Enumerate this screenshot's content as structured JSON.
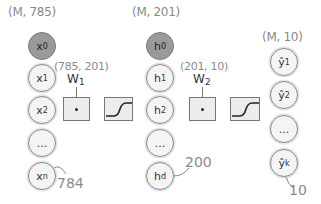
{
  "input_layer": {
    "shape": "(M, 785)",
    "nodes": [
      {
        "symbol": "x",
        "sub": "0",
        "bias": true
      },
      {
        "symbol": "x",
        "sub": "1",
        "bias": false
      },
      {
        "symbol": "x",
        "sub": "2",
        "bias": false
      },
      {
        "symbol": "...",
        "sub": "",
        "bias": false
      },
      {
        "symbol": "x",
        "sub": "n",
        "bias": false
      }
    ],
    "count_annotation": "784"
  },
  "weights_1": {
    "label": "W",
    "sub": "1",
    "shape": "(785, 201)",
    "operation": "dot-product"
  },
  "activation_1": {
    "type": "sigmoid"
  },
  "hidden_layer": {
    "shape": "(M, 201)",
    "nodes": [
      {
        "symbol": "h",
        "sub": "0",
        "bias": true
      },
      {
        "symbol": "h",
        "sub": "1",
        "bias": false
      },
      {
        "symbol": "h",
        "sub": "2",
        "bias": false
      },
      {
        "symbol": "...",
        "sub": "",
        "bias": false
      },
      {
        "symbol": "h",
        "sub": "d",
        "bias": false
      }
    ],
    "count_annotation": "200"
  },
  "weights_2": {
    "label": "W",
    "sub": "2",
    "shape": "(201, 10)",
    "operation": "dot-product"
  },
  "activation_2": {
    "type": "sigmoid"
  },
  "output_layer": {
    "shape": "(M, 10)",
    "nodes": [
      {
        "symbol": "ŷ",
        "sub": "1"
      },
      {
        "symbol": "ŷ",
        "sub": "2"
      },
      {
        "symbol": "...",
        "sub": ""
      },
      {
        "symbol": "ŷ",
        "sub": "k"
      }
    ],
    "count_annotation": "10"
  },
  "colors": {
    "bias_fill": "#9a9a9a",
    "node_fill": "#f4f4f4",
    "box_fill": "#ececec",
    "annotation": "#8a8a8a"
  }
}
